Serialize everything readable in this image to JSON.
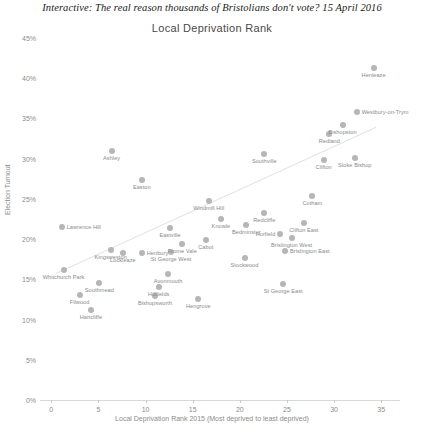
{
  "header": {
    "headline": "Interactive: The real reason thousands of Bristolians don't vote? 15 April 2016"
  },
  "chart_data": {
    "type": "scatter",
    "title": "Local Deprivation Rank",
    "xlabel": "Local Deprivation Rank 2015 (Most deprived to least deprived)",
    "ylabel": "Election Turnout",
    "xlim": [
      -1.2,
      37
    ],
    "ylim": [
      0,
      45
    ],
    "grid": false,
    "legend": "none",
    "xticks": [
      "0",
      "5",
      "10",
      "15",
      "20",
      "25",
      "30",
      "35"
    ],
    "xtick_values": [
      0,
      5,
      10,
      15,
      20,
      25,
      30,
      35
    ],
    "yticks": [
      "0%",
      "5%",
      "10%",
      "15%",
      "20%",
      "25%",
      "30%",
      "35%",
      "40%",
      "45%"
    ],
    "ytick_values": [
      0,
      5,
      10,
      15,
      20,
      25,
      30,
      35,
      40,
      45
    ],
    "marker_color": "#b6b6b6",
    "trendline": {
      "x0": 0.5,
      "y0": 15.8,
      "x1": 34.5,
      "y1": 34.0,
      "color": "#e4e4e4"
    },
    "points": [
      {
        "label": "Hartcliffe",
        "x": 4.2,
        "y": 11.2,
        "anchor": "center"
      },
      {
        "label": "Filwood",
        "x": 3.0,
        "y": 13.0,
        "anchor": "center"
      },
      {
        "label": "Whitchurch Park",
        "x": 1.3,
        "y": 16.1,
        "anchor": "center"
      },
      {
        "label": "Southmead",
        "x": 5.1,
        "y": 14.6,
        "anchor": "center"
      },
      {
        "label": "Lawrence Hill",
        "x": 1.1,
        "y": 21.5,
        "anchor": "left"
      },
      {
        "label": "Kingsweston",
        "x": 6.3,
        "y": 18.6,
        "anchor": "center"
      },
      {
        "label": "Lockleaze",
        "x": 7.6,
        "y": 18.3,
        "anchor": "center"
      },
      {
        "label": "Henbury",
        "x": 9.6,
        "y": 18.3,
        "anchor": "left"
      },
      {
        "label": "Bishopsworth",
        "x": 11.0,
        "y": 12.9,
        "anchor": "center"
      },
      {
        "label": "Hillfields",
        "x": 11.4,
        "y": 14.0,
        "anchor": "center"
      },
      {
        "label": "Avonmouth",
        "x": 12.4,
        "y": 15.7,
        "anchor": "center"
      },
      {
        "label": "Hengrove",
        "x": 15.6,
        "y": 12.6,
        "anchor": "center"
      },
      {
        "label": "St George West",
        "x": 12.7,
        "y": 18.4,
        "anchor": "center"
      },
      {
        "label": "Frome Vale",
        "x": 13.9,
        "y": 19.4,
        "anchor": "center"
      },
      {
        "label": "Cabot",
        "x": 16.4,
        "y": 19.9,
        "anchor": "center"
      },
      {
        "label": "Eastville",
        "x": 12.6,
        "y": 21.4,
        "anchor": "center"
      },
      {
        "label": "Easton",
        "x": 9.6,
        "y": 27.4,
        "anchor": "center"
      },
      {
        "label": "Ashley",
        "x": 6.4,
        "y": 31.0,
        "anchor": "center"
      },
      {
        "label": "Knowle",
        "x": 18.0,
        "y": 22.5,
        "anchor": "center"
      },
      {
        "label": "Stockwood",
        "x": 20.5,
        "y": 17.6,
        "anchor": "center"
      },
      {
        "label": "Windmill Hill",
        "x": 16.7,
        "y": 24.7,
        "anchor": "center"
      },
      {
        "label": "Bedminster",
        "x": 20.7,
        "y": 21.7,
        "anchor": "center"
      },
      {
        "label": "Southville",
        "x": 22.6,
        "y": 30.6,
        "anchor": "center"
      },
      {
        "label": "Redcliffe",
        "x": 22.6,
        "y": 23.3,
        "anchor": "center"
      },
      {
        "label": "Horfield",
        "x": 24.3,
        "y": 20.6,
        "anchor": "right"
      },
      {
        "label": "Brislington West",
        "x": 25.5,
        "y": 20.2,
        "anchor": "center"
      },
      {
        "label": "Brislington East",
        "x": 24.8,
        "y": 18.5,
        "anchor": "left"
      },
      {
        "label": "St George East",
        "x": 24.6,
        "y": 14.4,
        "anchor": "center"
      },
      {
        "label": "Clifton East",
        "x": 26.8,
        "y": 22.0,
        "anchor": "center"
      },
      {
        "label": "Cotham",
        "x": 27.7,
        "y": 25.3,
        "anchor": "center"
      },
      {
        "label": "Clifton",
        "x": 28.9,
        "y": 29.8,
        "anchor": "center"
      },
      {
        "label": "Redland",
        "x": 29.5,
        "y": 33.1,
        "anchor": "center"
      },
      {
        "label": "Bishopston",
        "x": 30.9,
        "y": 34.2,
        "anchor": "center"
      },
      {
        "label": "Stoke Bishop",
        "x": 32.2,
        "y": 30.1,
        "anchor": "center"
      },
      {
        "label": "Westbury-on-Trym",
        "x": 32.4,
        "y": 35.8,
        "anchor": "left"
      },
      {
        "label": "Henleaze",
        "x": 34.2,
        "y": 41.3,
        "anchor": "center"
      }
    ]
  }
}
